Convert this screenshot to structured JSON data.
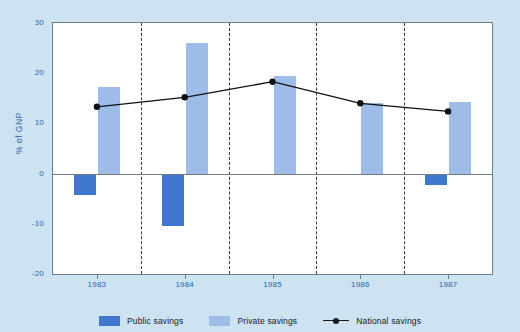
{
  "chart_data": {
    "type": "bar",
    "title": "",
    "xlabel": "",
    "ylabel": "% of GNP",
    "categories": [
      "1983",
      "1984",
      "1985",
      "1986",
      "1987"
    ],
    "ylim": [
      -20,
      30
    ],
    "yticks": [
      30,
      20,
      10,
      0,
      -10,
      -20
    ],
    "ytick_labels": [
      "30",
      "20",
      "10",
      "0",
      "-10",
      "-20"
    ],
    "grid": false,
    "legend_position": "bottom",
    "series": [
      {
        "name": "Public savings",
        "kind": "bar",
        "color": "#3f77cf",
        "values": [
          -4.3,
          -10.5,
          0.0,
          0.0,
          -2.2
        ]
      },
      {
        "name": "Private savings",
        "kind": "bar",
        "color": "#9dbce8",
        "values": [
          17.2,
          26.0,
          19.5,
          14.0,
          14.2
        ]
      },
      {
        "name": "National savings",
        "kind": "line",
        "color": "#0d1014",
        "marker": "circle",
        "values": [
          13.3,
          15.2,
          18.3,
          14.0,
          12.4
        ]
      }
    ]
  },
  "axis": {
    "y_label": "% of GNP",
    "y_ticks": [
      "30",
      "20",
      "10",
      "0",
      "-10",
      "-20"
    ],
    "x_ticks": [
      "1983",
      "1984",
      "1985",
      "1986",
      "1987"
    ]
  },
  "legend": {
    "items": [
      {
        "label": "Public savings",
        "icon": "color-swatch-icon",
        "color": "#3f77cf"
      },
      {
        "label": "Private savings",
        "icon": "color-swatch-icon",
        "color": "#9dbce8"
      },
      {
        "label": "National savings",
        "icon": "line-marker-icon",
        "color": "#0d1014"
      }
    ]
  },
  "colors": {
    "background": "#cde3f2",
    "plot_background": "#ffffff",
    "frame": "#6b7c8c",
    "axis_text": "#2d63a8",
    "public": "#3f77cf",
    "private": "#9dbce8",
    "national": "#0d1014"
  }
}
